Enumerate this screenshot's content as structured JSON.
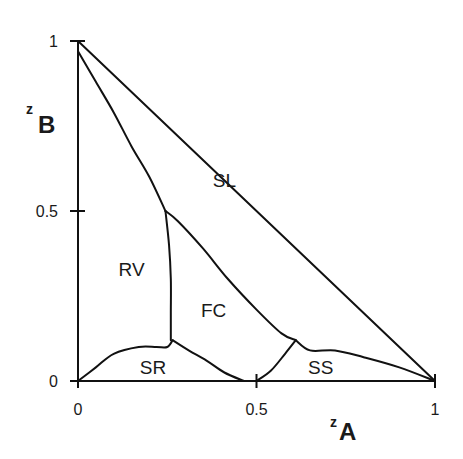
{
  "chart_data": {
    "type": "line",
    "title": "",
    "subtitle": "",
    "xlabel": {
      "prefix": "z",
      "main": "A"
    },
    "ylabel": {
      "prefix": "z",
      "main": "B"
    },
    "xlim": [
      0,
      1
    ],
    "ylim": [
      0,
      1
    ],
    "grid": false,
    "legend": null,
    "x_ticks": [
      {
        "value": 0,
        "label": "0"
      },
      {
        "value": 0.5,
        "label": "0.5"
      },
      {
        "value": 1,
        "label": "1"
      }
    ],
    "y_ticks": [
      {
        "value": 0,
        "label": "0"
      },
      {
        "value": 0.5,
        "label": "0.5"
      },
      {
        "value": 1,
        "label": "1"
      }
    ],
    "regions": [
      {
        "label": "SL",
        "x": 0.41,
        "y": 0.59
      },
      {
        "label": "RV",
        "x": 0.15,
        "y": 0.33
      },
      {
        "label": "FC",
        "x": 0.38,
        "y": 0.21
      },
      {
        "label": "SR",
        "x": 0.21,
        "y": 0.04
      },
      {
        "label": "SS",
        "x": 0.68,
        "y": 0.04
      }
    ],
    "series": [
      {
        "name": "x-axis",
        "points": [
          [
            0,
            0
          ],
          [
            1,
            0
          ]
        ]
      },
      {
        "name": "y-axis",
        "points": [
          [
            0,
            0
          ],
          [
            0,
            1
          ]
        ]
      },
      {
        "name": "diagonal z_A+z_B=1",
        "points": [
          [
            0,
            1
          ],
          [
            1,
            0
          ]
        ]
      },
      {
        "name": "RV-SL boundary",
        "points": [
          [
            0,
            0.97
          ],
          [
            0.05,
            0.88
          ],
          [
            0.1,
            0.79
          ],
          [
            0.15,
            0.69
          ],
          [
            0.2,
            0.6
          ],
          [
            0.245,
            0.5
          ]
        ]
      },
      {
        "name": "SL-FC boundary",
        "points": [
          [
            0.245,
            0.5
          ],
          [
            0.28,
            0.47
          ],
          [
            0.35,
            0.39
          ],
          [
            0.42,
            0.3
          ],
          [
            0.5,
            0.21
          ],
          [
            0.57,
            0.14
          ],
          [
            0.61,
            0.12
          ]
        ]
      },
      {
        "name": "RV-FC boundary",
        "points": [
          [
            0.245,
            0.5
          ],
          [
            0.255,
            0.4
          ],
          [
            0.26,
            0.3
          ],
          [
            0.26,
            0.2
          ],
          [
            0.26,
            0.12
          ]
        ]
      },
      {
        "name": "RV-SR boundary",
        "points": [
          [
            0,
            0
          ],
          [
            0.05,
            0.04
          ],
          [
            0.1,
            0.08
          ],
          [
            0.17,
            0.1
          ],
          [
            0.22,
            0.1
          ],
          [
            0.25,
            0.1
          ],
          [
            0.265,
            0.12
          ]
        ]
      },
      {
        "name": "SR-FC boundary",
        "points": [
          [
            0.265,
            0.12
          ],
          [
            0.31,
            0.09
          ],
          [
            0.36,
            0.06
          ],
          [
            0.41,
            0.025
          ],
          [
            0.465,
            0.0
          ]
        ]
      },
      {
        "name": "FC-SS boundary",
        "points": [
          [
            0.5,
            0.0
          ],
          [
            0.54,
            0.03
          ],
          [
            0.58,
            0.08
          ],
          [
            0.61,
            0.12
          ]
        ]
      },
      {
        "name": "SL-SS boundary",
        "points": [
          [
            0.61,
            0.12
          ],
          [
            0.65,
            0.09
          ],
          [
            0.72,
            0.09
          ],
          [
            0.8,
            0.07
          ],
          [
            0.9,
            0.04
          ],
          [
            1,
            0
          ]
        ]
      }
    ]
  },
  "plot_area": {
    "x0": 78,
    "y0": 381,
    "x1": 435,
    "y1": 41
  }
}
